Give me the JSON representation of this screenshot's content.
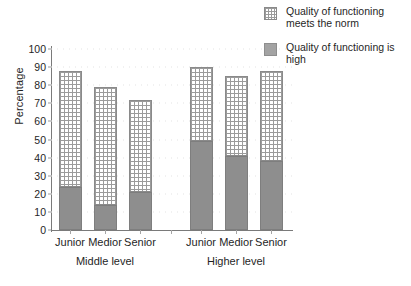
{
  "chart_data": {
    "type": "bar",
    "subtype": "stacked-bar",
    "title": "",
    "xlabel": "",
    "ylabel": "Percentage",
    "ylim": [
      0,
      100
    ],
    "ytick_step": 10,
    "yticks": [
      0,
      10,
      20,
      30,
      40,
      50,
      60,
      70,
      80,
      90,
      100
    ],
    "grid": false,
    "legend_position": "top-right",
    "categories": [
      "Junior",
      "Medior",
      "Senior",
      "Junior",
      "Medior",
      "Senior"
    ],
    "groups": [
      {
        "label": "Middle level",
        "categories": [
          "Junior",
          "Medior",
          "Senior"
        ]
      },
      {
        "label": "Higher level",
        "categories": [
          "Junior",
          "Medior",
          "Senior"
        ]
      }
    ],
    "series": [
      {
        "name": "Quality of functioning is high",
        "pattern": "solid",
        "color": "#8e8e8e",
        "values": [
          24,
          14,
          21,
          49,
          41,
          38
        ]
      },
      {
        "name": "Quality of functioning meets the norm",
        "pattern": "grid-crosshatch",
        "color": "#ffffff",
        "values": [
          64,
          65,
          51,
          41,
          44,
          50
        ]
      }
    ],
    "stack_totals": [
      88,
      79,
      72,
      90,
      85,
      88
    ],
    "bars": [
      {
        "category": "Junior",
        "group": "Middle level",
        "high": 24,
        "total": 88
      },
      {
        "category": "Medior",
        "group": "Middle level",
        "high": 14,
        "total": 79
      },
      {
        "category": "Senior",
        "group": "Middle level",
        "high": 21,
        "total": 72
      },
      {
        "category": "Junior",
        "group": "Higher level",
        "high": 49,
        "total": 90
      },
      {
        "category": "Medior",
        "group": "Higher level",
        "high": 41,
        "total": 85
      },
      {
        "category": "Senior",
        "group": "Higher level",
        "high": 38,
        "total": 88
      }
    ]
  },
  "axis": {
    "y_title": "Percentage",
    "y_ticks": [
      "0",
      "10",
      "20",
      "30",
      "40",
      "50",
      "60",
      "70",
      "80",
      "90",
      "100"
    ]
  },
  "legend": {
    "items": [
      {
        "label": "Quality of functioning meets the norm",
        "swatch": "grid-pattern-swatch"
      },
      {
        "label": "Quality of functioning is high",
        "swatch": "solid-gray-swatch"
      }
    ]
  },
  "x_axis": {
    "bar_labels": [
      "Junior",
      "Medior",
      "Senior",
      "Junior",
      "Medior",
      "Senior"
    ],
    "group_labels": [
      "Middle level",
      "Higher level"
    ]
  }
}
